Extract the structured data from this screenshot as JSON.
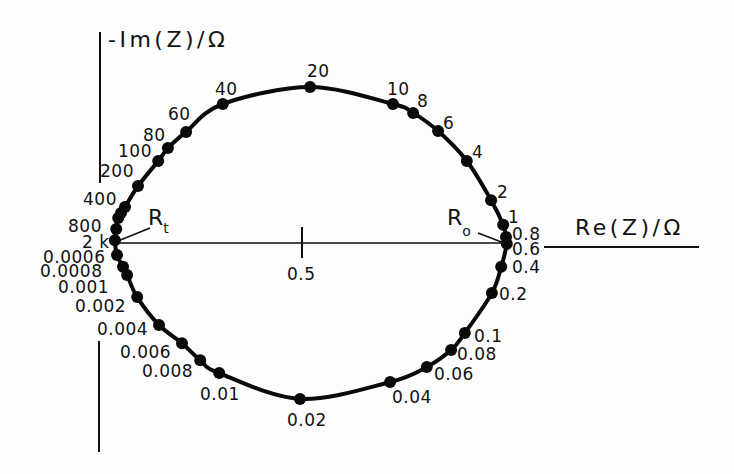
{
  "figure": {
    "y_axis_label": "-Im(Z)/Ω",
    "x_axis_label": "Re(Z)/Ω",
    "x_tick_label": "0.5",
    "r_t": {
      "main": "R",
      "sub": "t"
    },
    "r_o": {
      "main": "R",
      "sub": "o"
    }
  },
  "chart_data": {
    "type": "line",
    "title": "",
    "xlabel": "Re(Z)/Ω",
    "ylabel": "-Im(Z)/Ω",
    "xticks": [
      {
        "value": 0.5,
        "label": "0.5"
      }
    ],
    "xlim": [
      0,
      1.48
    ],
    "ylim": [
      -0.52,
      0.52
    ],
    "grid": false,
    "legend": "none",
    "annotations": [
      {
        "text": "R_t",
        "re": 0.037,
        "neg_im": 0.0,
        "note": "left real-axis intercept"
      },
      {
        "text": "R_o",
        "re": 1.007,
        "neg_im": 0.0,
        "note": "right real-axis intercept"
      }
    ],
    "series": [
      {
        "name": "Impedance locus (point labels = frequency)",
        "points": [
          {
            "label": "2 k",
            "re": 0.037,
            "neg_im": 0.007
          },
          {
            "label": "",
            "re": 0.04,
            "neg_im": 0.035
          },
          {
            "label": "800",
            "re": 0.045,
            "neg_im": 0.062
          },
          {
            "label": "",
            "re": 0.052,
            "neg_im": 0.074
          },
          {
            "label": "400",
            "re": 0.062,
            "neg_im": 0.089
          },
          {
            "label": "200",
            "re": 0.094,
            "neg_im": 0.141
          },
          {
            "label": "100",
            "re": 0.144,
            "neg_im": 0.203
          },
          {
            "label": "80",
            "re": 0.168,
            "neg_im": 0.235
          },
          {
            "label": "60",
            "re": 0.213,
            "neg_im": 0.275
          },
          {
            "label": "40",
            "re": 0.304,
            "neg_im": 0.344
          },
          {
            "label": "20",
            "re": 0.52,
            "neg_im": 0.386
          },
          {
            "label": "10",
            "re": 0.725,
            "neg_im": 0.344
          },
          {
            "label": "8",
            "re": 0.775,
            "neg_im": 0.322
          },
          {
            "label": "6",
            "re": 0.837,
            "neg_im": 0.277
          },
          {
            "label": "4",
            "re": 0.908,
            "neg_im": 0.203
          },
          {
            "label": "2",
            "re": 0.968,
            "neg_im": 0.106
          },
          {
            "label": "1",
            "re": 0.998,
            "neg_im": 0.045
          },
          {
            "label": "0.8",
            "re": 1.005,
            "neg_im": 0.015
          },
          {
            "label": "0.6",
            "re": 1.007,
            "neg_im": -0.002
          },
          {
            "label": "0.4",
            "re": 0.993,
            "neg_im": -0.059
          },
          {
            "label": "0.2",
            "re": 0.97,
            "neg_im": -0.124
          },
          {
            "label": "0.1",
            "re": 0.903,
            "neg_im": -0.223
          },
          {
            "label": "0.08",
            "re": 0.869,
            "neg_im": -0.265
          },
          {
            "label": "0.06",
            "re": 0.809,
            "neg_im": -0.307
          },
          {
            "label": "0.04",
            "re": 0.718,
            "neg_im": -0.344
          },
          {
            "label": "0.02",
            "re": 0.495,
            "neg_im": -0.386
          },
          {
            "label": "0.01",
            "re": 0.295,
            "neg_im": -0.322
          },
          {
            "label": "0.008",
            "re": 0.248,
            "neg_im": -0.29
          },
          {
            "label": "0.006",
            "re": 0.203,
            "neg_im": -0.248
          },
          {
            "label": "0.004",
            "re": 0.146,
            "neg_im": -0.203
          },
          {
            "label": "0.002",
            "re": 0.092,
            "neg_im": -0.134
          },
          {
            "label": "0.001",
            "re": 0.067,
            "neg_im": -0.079
          },
          {
            "label": "0.0008",
            "re": 0.057,
            "neg_im": -0.059
          },
          {
            "label": "0.0006",
            "re": 0.042,
            "neg_im": -0.03
          }
        ]
      }
    ]
  }
}
